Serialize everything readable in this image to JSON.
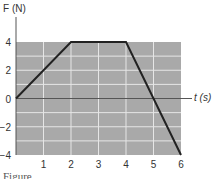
{
  "chart_data": {
    "type": "line",
    "title": "",
    "ylabel": "F (N)",
    "xlabel": "t (s)",
    "x": [
      0,
      2,
      4,
      6
    ],
    "series": [
      {
        "name": "Force",
        "values": [
          0,
          4,
          4,
          -4
        ]
      }
    ],
    "xlim": [
      0,
      6
    ],
    "ylim": [
      -4,
      4
    ],
    "xticks": [
      "1",
      "2",
      "3",
      "4",
      "5",
      "6"
    ],
    "yticks": [
      "4",
      "2",
      "0",
      "-2",
      "-4"
    ],
    "grid": true,
    "legend": "none"
  },
  "labels": {
    "y_axis": "F (N)",
    "x_axis": "t (s)",
    "caption": "Figure"
  },
  "colors": {
    "plot_bg": "#a9a9a9",
    "grid": "#e6e6e6",
    "line": "#222222",
    "axis": "#555555"
  }
}
